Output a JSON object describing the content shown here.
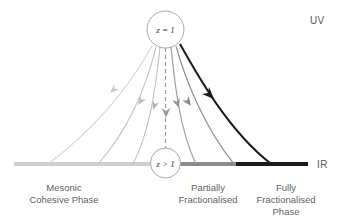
{
  "figure": {
    "title": "",
    "background": "#ffffff",
    "nodes": [
      {
        "id": "uv-node",
        "label": "z = 1",
        "x": 165.5,
        "y": 29.5,
        "r": 18.5
      },
      {
        "id": "ir-node",
        "label": "z > 1",
        "x": 165.5,
        "y": 163.0,
        "r": 15.0
      }
    ],
    "endpoints": {
      "uv": {
        "label": "UV",
        "x": 310,
        "y": 24
      },
      "ir": {
        "label": "IR",
        "x": 318,
        "y": 166
      }
    },
    "axis": {
      "y": 164,
      "thickness": 4,
      "segments": [
        {
          "name": "mesonic-cohesive-segment",
          "x1": 14,
          "x2": 150,
          "color": "#cfcfcf"
        },
        {
          "name": "partially-fractionalised-segment",
          "x1": 181,
          "x2": 236,
          "color": "#8a8a8a"
        },
        {
          "name": "fully-fractionalised-segment",
          "x1": 236,
          "x2": 308,
          "color": "#1a1a1a"
        }
      ]
    },
    "phase_labels": [
      {
        "id": "mesonic-cohesive-phase",
        "lines": [
          "Mesonic",
          "Cohesive Phase"
        ],
        "cx": 64,
        "y": 186
      },
      {
        "id": "partially-fractionalised",
        "lines": [
          "Partially",
          "Fractionalised"
        ],
        "cx": 208,
        "y": 186
      },
      {
        "id": "fully-fractionalised-phase",
        "lines": [
          "Fully",
          "Fractionalised",
          "Phase"
        ],
        "cx": 285,
        "y": 186
      }
    ],
    "flows": [
      {
        "id": "flow-1",
        "color": "#d3d3d3",
        "width": 1.1,
        "path": "M 152,46 C 133,80 100,125 48,164",
        "arrow": {
          "x": 110,
          "y": 93,
          "angle": 137
        }
      },
      {
        "id": "flow-2",
        "color": "#c6c6c6",
        "width": 1.1,
        "path": "M 156,47 C 147,84 130,128 98,164",
        "arrow": {
          "x": 138,
          "y": 105,
          "angle": 123
        }
      },
      {
        "id": "flow-3",
        "color": "#c0c0c0",
        "width": 1.1,
        "path": "M 160,47 C 156,86 150,131 133,164",
        "arrow": {
          "x": 153,
          "y": 110,
          "angle": 109
        }
      },
      {
        "id": "flow-4-dashed",
        "color": "#9a9a9a",
        "width": 1.2,
        "dashed": true,
        "path": "M 165.5,48 L 165.5,148",
        "arrow": {
          "x": 165.5,
          "y": 116,
          "angle": 90
        }
      },
      {
        "id": "flow-5",
        "color": "#9e9e9e",
        "width": 1.2,
        "path": "M 171,47 C 175,86 180,131 196,164",
        "arrow": {
          "x": 178,
          "y": 107,
          "angle": 72
        }
      },
      {
        "id": "flow-6",
        "color": "#8f8f8f",
        "width": 1.2,
        "path": "M 176,46 C 186,82 205,128 234,164",
        "arrow": {
          "x": 190,
          "y": 105,
          "angle": 55
        }
      },
      {
        "id": "flow-7-dark",
        "color": "#1a1a1a",
        "width": 2.0,
        "path": "M 180,44 C 198,76 228,130 270,163",
        "arrow": {
          "x": 212,
          "y": 97,
          "angle": 45
        }
      }
    ]
  }
}
